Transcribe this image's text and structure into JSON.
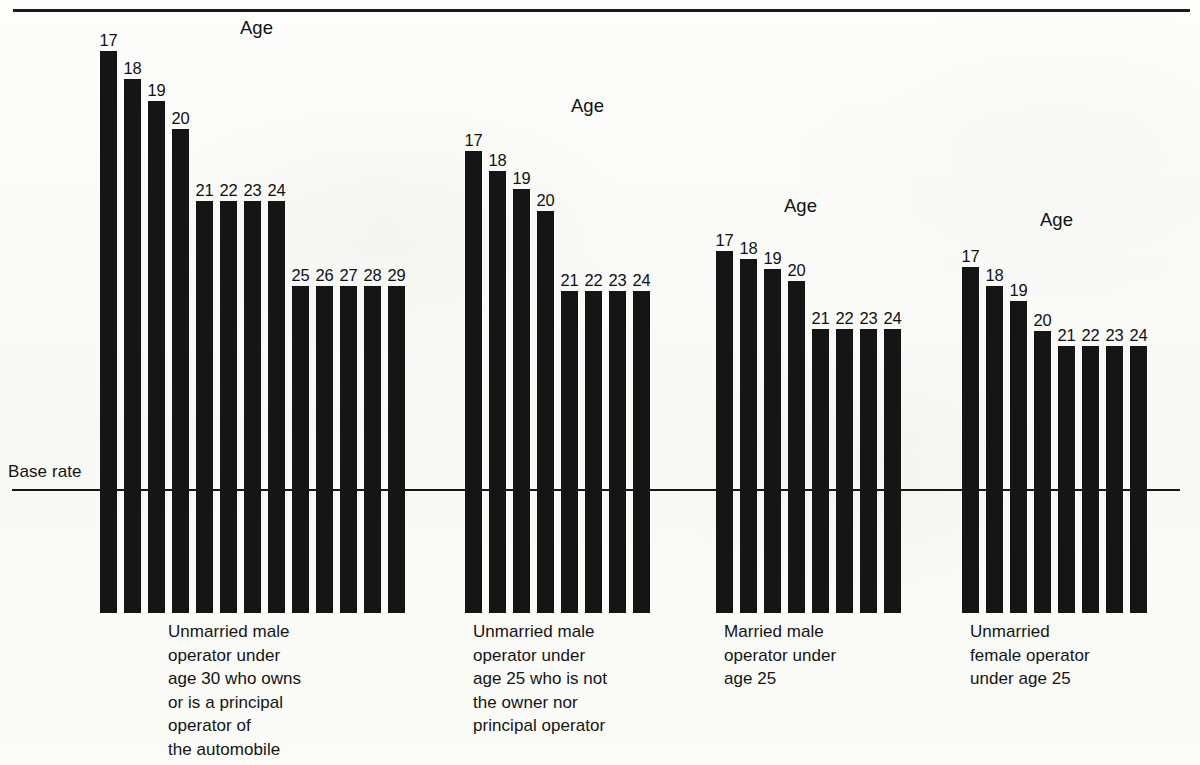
{
  "chart_data": {
    "type": "bar",
    "title": "",
    "subtitle": "",
    "xlabel": "",
    "ylabel": "",
    "baseline_label": "Base rate",
    "series_axis_title": "Age",
    "grid": false,
    "legend_position": "none",
    "groups": [
      {
        "id": "unmarried-male-owner-under-30",
        "caption": "Unmarried male\noperator under\nage 30 who owns\nor is a principal\noperator of\nthe automobile",
        "age_title": "Age",
        "categories": [
          "17",
          "18",
          "19",
          "20",
          "21",
          "22",
          "23",
          "24",
          "25",
          "26",
          "27",
          "28",
          "29"
        ],
        "values": [
          562,
          534,
          512,
          484,
          412,
          412,
          412,
          412,
          327,
          327,
          327,
          327,
          327
        ]
      },
      {
        "id": "unmarried-male-nonowner-under-25",
        "caption": "Unmarried male\noperator under\nage 25 who is not\nthe owner nor\nprincipal operator",
        "age_title": "Age",
        "categories": [
          "17",
          "18",
          "19",
          "20",
          "21",
          "22",
          "23",
          "24"
        ],
        "values": [
          462,
          442,
          424,
          402,
          322,
          322,
          322,
          322
        ]
      },
      {
        "id": "married-male-under-25",
        "caption": "Married male\noperator under\nage 25",
        "age_title": "Age",
        "categories": [
          "17",
          "18",
          "19",
          "20",
          "21",
          "22",
          "23",
          "24"
        ],
        "values": [
          362,
          354,
          344,
          332,
          284,
          284,
          284,
          284
        ]
      },
      {
        "id": "unmarried-female-under-25",
        "caption": "Unmarried\nfemale operator\nunder age 25",
        "age_title": "Age",
        "categories": [
          "17",
          "18",
          "19",
          "20",
          "21",
          "22",
          "23",
          "24"
        ],
        "values": [
          346,
          327,
          312,
          282,
          267,
          267,
          267,
          267
        ]
      }
    ],
    "colors": {
      "bar": "#151515",
      "baseline": "#17171a",
      "text": "#131313",
      "background": "#fbfbf9"
    }
  },
  "layout": {
    "bar_width": 17,
    "bar_pitch": 24,
    "plot_bottom_y": 613,
    "baseline_y": 490,
    "groups": [
      {
        "left": 100,
        "age_title_left": 140,
        "age_title_top": 18,
        "caption_left": 68,
        "caption_top": 620
      },
      {
        "left": 465,
        "age_title_left": 106,
        "age_title_top": 96,
        "caption_left": 8,
        "caption_top": 620
      },
      {
        "left": 716,
        "age_title_left": 68,
        "age_title_top": 196,
        "caption_left": 8,
        "caption_top": 620
      },
      {
        "left": 962,
        "age_title_left": 78,
        "age_title_top": 210,
        "caption_left": 8,
        "caption_top": 620
      }
    ]
  }
}
